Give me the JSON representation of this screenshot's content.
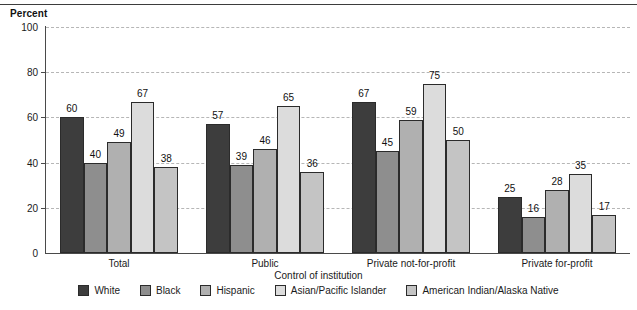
{
  "chart_data": {
    "type": "bar",
    "title": "",
    "ylabel": "Percent",
    "xlabel": "Control of institution",
    "ylim": [
      0,
      100
    ],
    "yticks": [
      0,
      20,
      40,
      60,
      80,
      100
    ],
    "grid": true,
    "legend_position": "bottom",
    "categories": [
      "Total",
      "Public",
      "Private not-for-profit",
      "Private for-profit"
    ],
    "series": [
      {
        "name": "White",
        "color": "#3d3d3d",
        "values": [
          60,
          57,
          67,
          25
        ]
      },
      {
        "name": "Black",
        "color": "#8e8e8e",
        "values": [
          40,
          39,
          45,
          16
        ]
      },
      {
        "name": "Hispanic",
        "color": "#b0b0b0",
        "values": [
          49,
          46,
          59,
          28
        ]
      },
      {
        "name": "Asian/Pacific Islander",
        "color": "#dcdcdc",
        "values": [
          67,
          65,
          75,
          35
        ]
      },
      {
        "name": "American Indian/Alaska Native",
        "color": "#c4c4c4",
        "values": [
          38,
          36,
          50,
          17
        ]
      }
    ]
  },
  "axis": {
    "y_title": "Percent",
    "x_title": "Control of institution",
    "y_tick_labels": [
      "0",
      "20",
      "40",
      "60",
      "80",
      "100"
    ]
  }
}
